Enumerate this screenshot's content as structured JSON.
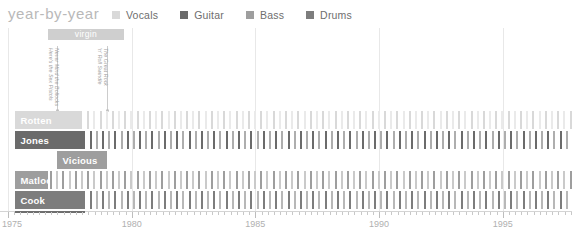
{
  "header": {
    "title": "year-by-year",
    "legend": [
      {
        "label": "Vocals",
        "color": "#d9d9d9",
        "icon": "square-swatch"
      },
      {
        "label": "Guitar",
        "color": "#6b6b6b",
        "icon": "square-swatch"
      },
      {
        "label": "Bass",
        "color": "#9e9e9e",
        "icon": "square-swatch"
      },
      {
        "label": "Drums",
        "color": "#7d7d7d",
        "icon": "square-swatch"
      }
    ]
  },
  "annotations": {
    "label_bars": [
      {
        "text": "virgin",
        "start_year": 1976.6,
        "end_year": 1979.7,
        "color": "#cfcfcf"
      }
    ],
    "albums": [
      {
        "title": "Never Mind the Bollocks Here's the Sex Pistols",
        "year": 1977.0
      },
      {
        "title": "The Great Rock 'n' Roll Swindle",
        "year": 1979.0
      }
    ]
  },
  "chart_data": {
    "type": "bar",
    "title": "year-by-year",
    "xlabel": "",
    "ylabel": "",
    "xlim": [
      1975,
      1997.8
    ],
    "ticks_major": [
      1975,
      1980,
      1985,
      1990,
      1995
    ],
    "tick_labels": [
      "1975",
      "1980",
      "1985",
      "1990",
      "1995"
    ],
    "tick_interval_minor": 0.25,
    "grid": true,
    "legend_position": "top",
    "categories": [
      "Rotten",
      "Jones",
      "Vicious",
      "Matlock",
      "Cook"
    ],
    "series": [
      {
        "name": "Rotten",
        "role": "Vocals",
        "color": "#d9d9d9",
        "name_bg": "#d9d9d9",
        "active": [
          1975.3,
          1978.0
        ],
        "sparse_from": 1978.2,
        "sparse_to": 1997.8
      },
      {
        "name": "Jones",
        "role": "Guitar",
        "color": "#6b6b6b",
        "name_bg": "#6b6b6b",
        "active": [
          1975.3,
          1978.1
        ],
        "sparse_from": 1978.3,
        "sparse_to": 1997.8
      },
      {
        "name": "Vicious",
        "role": "Bass",
        "color": "#9e9e9e",
        "name_bg": "#9e9e9e",
        "active": [
          1977.0,
          1979.0
        ],
        "sparse_from": null,
        "sparse_to": null
      },
      {
        "name": "Matlock",
        "role": "Bass",
        "color": "#9e9e9e",
        "name_bg": "#9e9e9e",
        "active": [
          1975.3,
          1976.6
        ],
        "sparse_from": 1976.7,
        "sparse_to": 1997.8
      },
      {
        "name": "Cook",
        "role": "Drums",
        "color": "#7d7d7d",
        "name_bg": "#7d7d7d",
        "active": [
          1975.3,
          1978.1
        ],
        "sparse_from": 1978.3,
        "sparse_to": 1997.8
      }
    ]
  }
}
